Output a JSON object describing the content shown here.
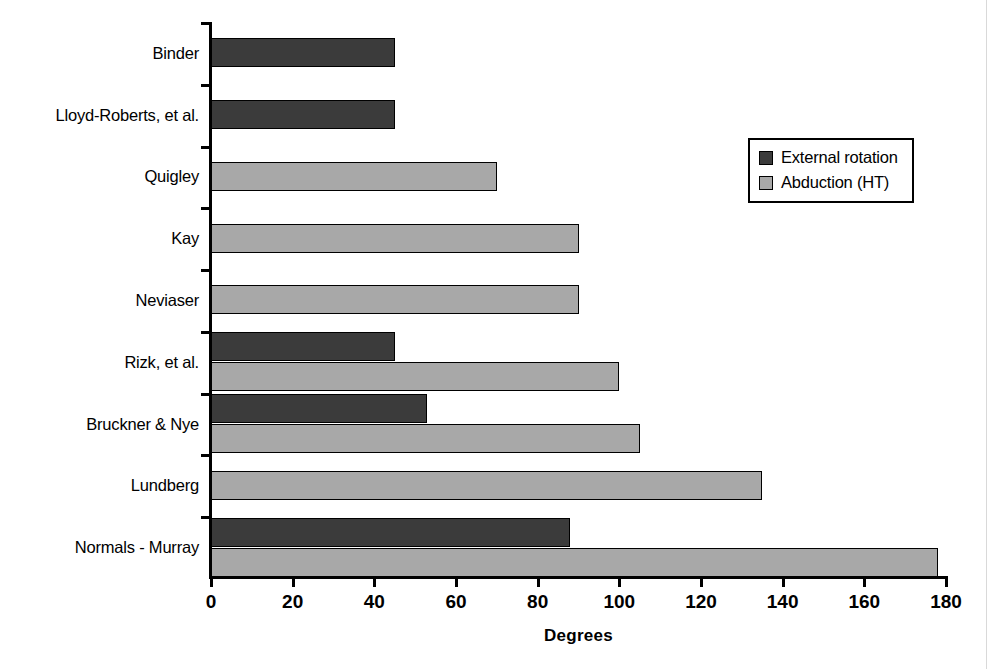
{
  "chart_data": {
    "type": "bar",
    "orientation": "horizontal",
    "title": "",
    "xlabel": "Degrees",
    "ylabel": "",
    "xlim": [
      0,
      180
    ],
    "xticks": [
      0,
      20,
      40,
      60,
      80,
      100,
      120,
      140,
      160,
      180
    ],
    "grid": false,
    "legend_position": "upper right",
    "categories": [
      "Binder",
      "Lloyd-Roberts, et al.",
      "Quigley",
      "Kay",
      "Neviaser",
      "Rizk, et al.",
      "Bruckner & Nye",
      "Lundberg",
      "Normals - Murray"
    ],
    "series": [
      {
        "name": "External rotation",
        "color": "#3b3b3b",
        "values": [
          45,
          45,
          null,
          null,
          null,
          45,
          53,
          null,
          88
        ]
      },
      {
        "name": "Abduction (HT)",
        "color": "#a8a8a8",
        "values": [
          null,
          null,
          70,
          90,
          90,
          100,
          105,
          135,
          178
        ]
      }
    ]
  },
  "legend": {
    "items": [
      {
        "label": "External rotation"
      },
      {
        "label": "Abduction (HT)"
      }
    ]
  },
  "axis": {
    "x_title": "Degrees",
    "tick_labels": [
      "0",
      "20",
      "40",
      "60",
      "80",
      "100",
      "120",
      "140",
      "160",
      "180"
    ]
  }
}
